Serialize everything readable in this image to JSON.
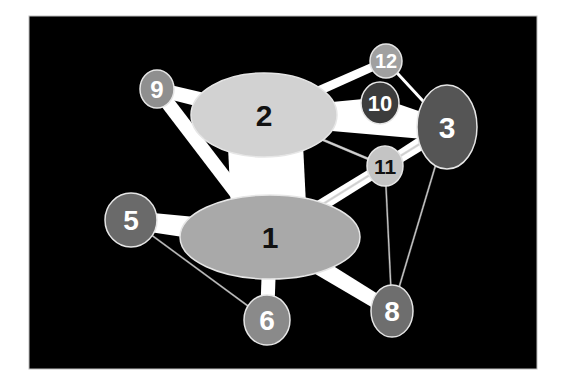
{
  "diagram": {
    "type": "network-graph",
    "background": "#000000",
    "frame": {
      "x": 29,
      "y": 16,
      "w": 508,
      "h": 353
    },
    "nodes": [
      {
        "id": "1",
        "label": "1",
        "cx": 270,
        "cy": 237,
        "rx": 90,
        "ry": 42,
        "fill": "#a9a9a9",
        "text": "#111111",
        "font": 30
      },
      {
        "id": "2",
        "label": "2",
        "cx": 264,
        "cy": 115,
        "rx": 73,
        "ry": 42,
        "fill": "#d2d2d2",
        "text": "#111111",
        "font": 30
      },
      {
        "id": "3",
        "label": "3",
        "cx": 447,
        "cy": 127,
        "rx": 30,
        "ry": 42,
        "fill": "#555555",
        "text": "#ffffff",
        "font": 30
      },
      {
        "id": "5",
        "label": "5",
        "cx": 131,
        "cy": 220,
        "rx": 26,
        "ry": 27,
        "fill": "#6a6a6a",
        "text": "#ffffff",
        "font": 28
      },
      {
        "id": "6",
        "label": "6",
        "cx": 267,
        "cy": 320,
        "rx": 23,
        "ry": 25,
        "fill": "#8a8a8a",
        "text": "#ffffff",
        "font": 28
      },
      {
        "id": "8",
        "label": "8",
        "cx": 392,
        "cy": 311,
        "rx": 21,
        "ry": 26,
        "fill": "#6e6e6e",
        "text": "#ffffff",
        "font": 28
      },
      {
        "id": "9",
        "label": "9",
        "cx": 157,
        "cy": 89,
        "rx": 17,
        "ry": 19,
        "fill": "#8f8f8f",
        "text": "#ffffff",
        "font": 24
      },
      {
        "id": "10",
        "label": "10",
        "cx": 380,
        "cy": 103,
        "rx": 19,
        "ry": 21,
        "fill": "#3c3c3c",
        "text": "#ffffff",
        "font": 22
      },
      {
        "id": "11",
        "label": "11",
        "cx": 385,
        "cy": 166,
        "rx": 18,
        "ry": 20,
        "fill": "#c4c4c4",
        "text": "#111111",
        "font": 21
      },
      {
        "id": "12",
        "label": "12",
        "cx": 386,
        "cy": 61,
        "rx": 16,
        "ry": 17,
        "fill": "#a0a0a0",
        "text": "#ffffff",
        "font": 20
      }
    ],
    "edges": [
      {
        "from": "1",
        "to": "2",
        "w1": 75,
        "w2": 75,
        "color": "#ffffff"
      },
      {
        "from": "2",
        "to": "3",
        "w1": 20,
        "w2": 28,
        "color": "#ffffff"
      },
      {
        "from": "2",
        "to": "9",
        "w1": 16,
        "w2": 14,
        "color": "#ffffff"
      },
      {
        "from": "1",
        "to": "9",
        "w1": 14,
        "w2": 14,
        "color": "#ffffff"
      },
      {
        "from": "2",
        "to": "12",
        "w1": 10,
        "w2": 8,
        "color": "#ffffff"
      },
      {
        "from": "2",
        "to": "10",
        "w1": 13,
        "w2": 11,
        "color": "#ffffff"
      },
      {
        "from": "10",
        "to": "3",
        "w1": 10,
        "w2": 12,
        "color": "#ffffff"
      },
      {
        "from": "12",
        "to": "3",
        "w1": 3,
        "w2": 3,
        "color": "#ffffff"
      },
      {
        "from": "2",
        "to": "11",
        "w1": 2,
        "w2": 2,
        "color": "#d0d0d0"
      },
      {
        "from": "11",
        "to": "3",
        "w1": 12,
        "w2": 14,
        "color": "#ffffff"
      },
      {
        "from": "1",
        "to": "11",
        "w1": 13,
        "w2": 11,
        "color": "#ffffff"
      },
      {
        "from": "1",
        "to": "3",
        "w1": 2,
        "w2": 2,
        "color": "#d0d0d0"
      },
      {
        "from": "1",
        "to": "5",
        "w1": 26,
        "w2": 18,
        "color": "#ffffff"
      },
      {
        "from": "1",
        "to": "6",
        "w1": 14,
        "w2": 14,
        "color": "#ffffff"
      },
      {
        "from": "1",
        "to": "8",
        "w1": 18,
        "w2": 14,
        "color": "#ffffff"
      },
      {
        "from": "5",
        "to": "6",
        "w1": 1.2,
        "w2": 1.2,
        "color": "#c0c0c0"
      },
      {
        "from": "11",
        "to": "8",
        "w1": 1.2,
        "w2": 1.2,
        "color": "#c8c8c8"
      },
      {
        "from": "3",
        "to": "8",
        "w1": 1.2,
        "w2": 1.2,
        "color": "#c8c8c8"
      }
    ]
  }
}
